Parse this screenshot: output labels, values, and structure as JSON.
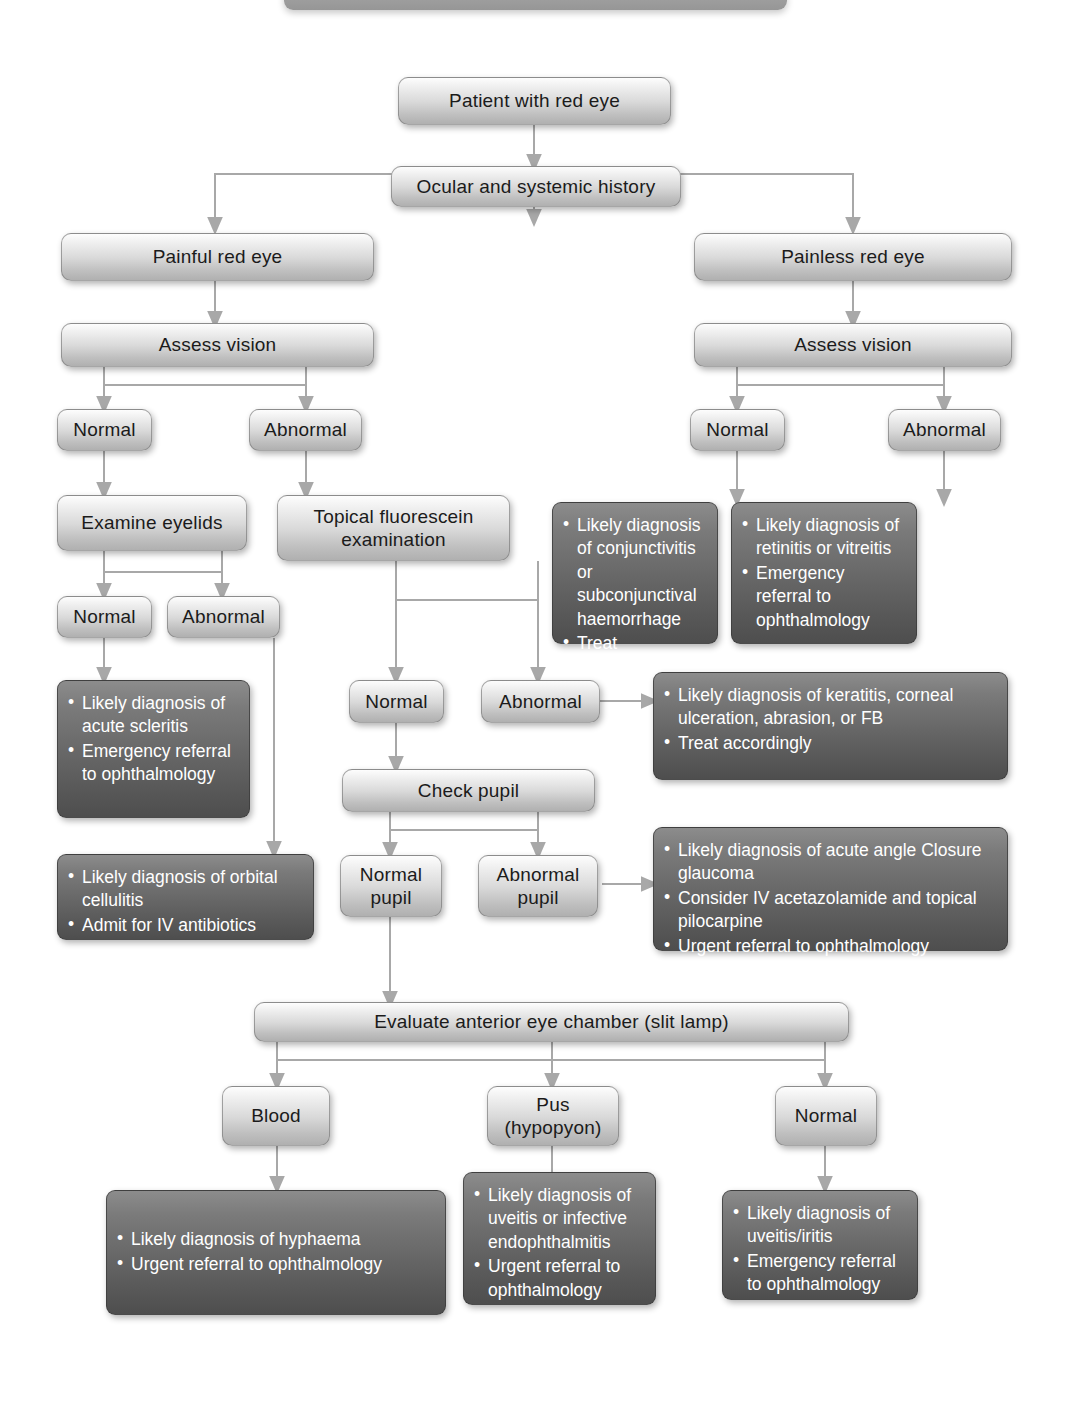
{
  "diagram": {
    "colors": {
      "light_node_fill": "#d9d9d9",
      "dark_node_fill": "#666666",
      "dark_node_text": "#ffffff",
      "light_node_text": "#1b1b1b",
      "connector": "#a6a6a6",
      "page_background": "#ffffff"
    }
  },
  "nodes": {
    "start": {
      "label": "Patient with red eye"
    },
    "history": {
      "label": "Ocular and systemic history"
    },
    "painful": {
      "label": "Painful red eye"
    },
    "painless": {
      "label": "Painless red eye"
    },
    "assess_vision_left": {
      "label": "Assess vision"
    },
    "assess_vision_right": {
      "label": "Assess vision"
    },
    "painful_normal": {
      "label": "Normal"
    },
    "painful_abnormal": {
      "label": "Abnormal"
    },
    "painless_normal": {
      "label": "Normal"
    },
    "painless_abnormal": {
      "label": "Abnormal"
    },
    "examine_eyelids": {
      "label": "Examine eyelids"
    },
    "fluorescein": {
      "line1": "Topical fluorescein",
      "line2": "examination"
    },
    "eyelids_normal": {
      "label": "Normal"
    },
    "eyelids_abnormal": {
      "label": "Abnormal"
    },
    "fluo_normal": {
      "label": "Normal"
    },
    "fluo_abnormal": {
      "label": "Abnormal"
    },
    "check_pupil": {
      "label": "Check pupil"
    },
    "normal_pupil": {
      "line1": "Normal",
      "line2": "pupil"
    },
    "abnormal_pupil": {
      "line1": "Abnormal",
      "line2": "pupil"
    },
    "evaluate_chamber": {
      "label": "Evaluate anterior eye chamber (slit lamp)"
    },
    "blood": {
      "label": "Blood"
    },
    "pus": {
      "line1": "Pus",
      "line2": "(hypopyon)"
    },
    "chamber_normal": {
      "label": "Normal"
    }
  },
  "outcomes": {
    "conjunctivitis": {
      "items": [
        "Likely diagnosis of conjunctivitis or subconjunctival haemorrhage",
        "Treat accordingly"
      ]
    },
    "retinitis": {
      "items": [
        "Likely diagnosis of retinitis or vitreitis",
        "Emergency referral to ophthalmology"
      ]
    },
    "scleritis": {
      "items": [
        "Likely diagnosis of acute scleritis",
        "Emergency referral to ophthalmology"
      ]
    },
    "cellulitis": {
      "items": [
        "Likely diagnosis of orbital cellulitis",
        "Admit for IV antibiotics"
      ]
    },
    "keratitis": {
      "items": [
        "Likely diagnosis of keratitis, corneal ulceration, abrasion, or FB",
        "Treat accordingly"
      ]
    },
    "glaucoma": {
      "items": [
        "Likely diagnosis of acute angle Closure glaucoma",
        "Consider IV acetazolamide and topical pilocarpine",
        "Urgent referral to ophthalmology"
      ]
    },
    "hyphaema": {
      "items": [
        "Likely diagnosis of hyphaema",
        "Urgent referral to ophthalmology"
      ]
    },
    "endophthalmitis": {
      "items": [
        "Likely diagnosis of uveitis or infective endophthalmitis",
        "Urgent referral to ophthalmology"
      ]
    },
    "uveitis_iritis": {
      "items": [
        "Likely diagnosis of uveitis/iritis",
        "Emergency referral to ophthalmology"
      ]
    }
  }
}
